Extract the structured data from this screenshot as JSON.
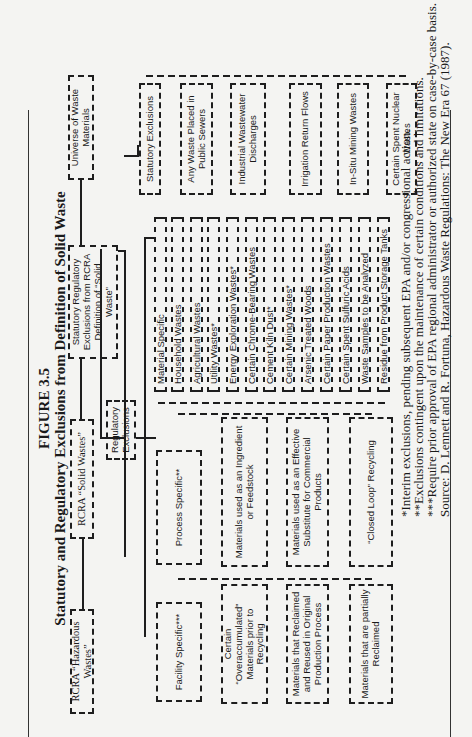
{
  "figure": {
    "number": "FIGURE 3.5",
    "title": "Statutory and Regulatory Exclusions from Definition of Solid Waste"
  },
  "top_level": {
    "universe": "Universe of Waste Materials",
    "statutory_regulatory": "Statutory Regulatory Exclusions from RCRA Definition of “Solid Waste”",
    "rcra_solid": "RCRA “Solid Wastes”",
    "rcra_hazardous": "RCRA “Hazardous Wastes”"
  },
  "branches": {
    "statutory_exclusions": "Statutory Exclusions",
    "regulatory_exclusions": "Regulatory Exclusions",
    "process_specific": "Process Specific**",
    "facility_specific": "Facility Specific***"
  },
  "statutory_items": [
    "Any Waste Placed in Public Sewers",
    "Industrial Wastewater Discharges",
    "Irrigation Return Flows",
    "In-Situ Mining Wastes",
    "Certain Spent Nuclear Wastes"
  ],
  "material_specific_items": [
    "Material Specific",
    "Household Wastes",
    "Agricultural Wastes",
    "Utility Wastes*",
    "Energy Exploration Wastes*",
    "Certain Chrome-Bearing Wastes",
    "Cement Kiln Dust*",
    "Certain Mining Wastes*",
    "Arsenic Treated Woods",
    "Certain Paper Production Wastes",
    "Certain Spent Sulfuric Acids",
    "Waste Samples to be Analyzed",
    "Residue from Product Storage Tanks"
  ],
  "process_items": [
    "Materials used as an Ingredient or Feedstock",
    "Materials used as an Effective Substitute for Commercial Products",
    "“Closed Loop” Recycling"
  ],
  "facility_items": [
    "Certain “Overaccumulated” Materials prior to Recycling",
    "Materials that Reclaimed and Reused in Original Production Process",
    "Materials that are partially Reclaimed"
  ],
  "footnotes": [
    "*Interim exclusions, pending subsequent EPA and/or congressional action.",
    "**Exclusions contingent upon the maintenance of certain conditions and limitations.",
    "***Require prior approval of EPA regional administrator or authorized state on case-by-case basis.",
    "Source: D. Lennett and R. Fortuna, Hazardous Waste Regulations: The New Era 67 (1987)."
  ]
}
